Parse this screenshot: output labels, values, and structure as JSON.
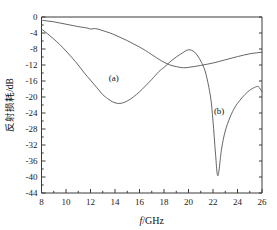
{
  "chart_data": {
    "type": "line",
    "title": "",
    "xlabel": "f/GHz",
    "xlabel_italic_part": "f",
    "xlabel_rest": "/GHz",
    "ylabel": "反射损耗/dB",
    "xlim": [
      8,
      26
    ],
    "ylim": [
      -44,
      0
    ],
    "xticks": [
      8,
      10,
      12,
      14,
      16,
      18,
      20,
      22,
      24,
      26
    ],
    "xtick_labels": [
      "8",
      "10",
      "12",
      "14",
      "16",
      "18",
      "20",
      "22",
      "24",
      "26"
    ],
    "yticks": [
      0,
      -4,
      -8,
      -12,
      -16,
      -20,
      -24,
      -28,
      -32,
      -36,
      -40,
      -44
    ],
    "ytick_labels": [
      "0",
      "-4",
      "-8",
      "-12",
      "-16",
      "-20",
      "-24",
      "-28",
      "-32",
      "-36",
      "-40",
      "-44"
    ],
    "xtick_minor_step": 0.5,
    "grid": false,
    "legend_position": "inline-annotation",
    "line_color": "#555555",
    "axis_color": "#3a3a3a",
    "annotations": [
      {
        "text": "(a)",
        "x": 13.9,
        "y": -16.0
      },
      {
        "text": "(b)",
        "x": 22.5,
        "y": -24.2
      }
    ],
    "series": [
      {
        "name": "(a)",
        "label": "(a)",
        "x": [
          8.0,
          8.5,
          9.0,
          9.5,
          10.0,
          10.5,
          11.0,
          11.4,
          11.8,
          12.0,
          12.4,
          12.8,
          13.2,
          13.6,
          14.0,
          14.5,
          15.0,
          15.5,
          16.0,
          16.5,
          17.0,
          17.6,
          18.0,
          18.5,
          19.0,
          19.6,
          20.2,
          21.0,
          22.0,
          23.0,
          24.0,
          25.0,
          26.0
        ],
        "y": [
          -0.8,
          -1.0,
          -1.2,
          -1.5,
          -1.8,
          -2.1,
          -2.4,
          -2.6,
          -2.8,
          -3.0,
          -2.9,
          -3.2,
          -3.6,
          -4.0,
          -4.5,
          -5.2,
          -5.9,
          -6.7,
          -7.5,
          -8.4,
          -9.4,
          -10.6,
          -11.3,
          -12.0,
          -12.4,
          -12.7,
          -12.5,
          -12.1,
          -11.5,
          -10.7,
          -9.9,
          -9.2,
          -8.8
        ],
        "notes": "upper curve; shallow gradual decline, broad minimum near 19.6 GHz at about -12.7 dB"
      },
      {
        "name": "(b)",
        "label": "(b)",
        "x": [
          8.0,
          8.5,
          9.0,
          9.5,
          10.0,
          10.5,
          11.0,
          11.5,
          12.0,
          12.5,
          13.0,
          13.4,
          13.8,
          14.2,
          14.6,
          15.0,
          15.5,
          16.0,
          16.5,
          17.0,
          17.6,
          18.0,
          18.5,
          19.0,
          19.5,
          20.0,
          20.5,
          21.0,
          21.4,
          21.8,
          22.0,
          22.2,
          22.4,
          22.7,
          23.0,
          23.4,
          23.8,
          24.2,
          24.6,
          25.0,
          25.4,
          25.7,
          26.0
        ],
        "y": [
          -3.0,
          -4.2,
          -5.5,
          -6.9,
          -8.5,
          -10.2,
          -12.0,
          -14.0,
          -15.8,
          -17.6,
          -19.4,
          -20.4,
          -21.2,
          -21.6,
          -21.5,
          -21.0,
          -20.0,
          -18.7,
          -17.2,
          -15.6,
          -13.6,
          -12.6,
          -11.2,
          -10.0,
          -9.0,
          -8.2,
          -8.8,
          -11.0,
          -14.0,
          -20.0,
          -26.0,
          -34.0,
          -39.7,
          -33.0,
          -28.5,
          -25.0,
          -22.5,
          -20.8,
          -19.4,
          -18.3,
          -17.6,
          -17.4,
          -18.7
        ],
        "notes": "lower curve; first broad minimum near 14.2 GHz at about -21.6 dB, sharp deep resonance near 22.4 GHz reaching about -39.7 dB, local max near 25.7 GHz at -17.4 dB"
      }
    ]
  }
}
